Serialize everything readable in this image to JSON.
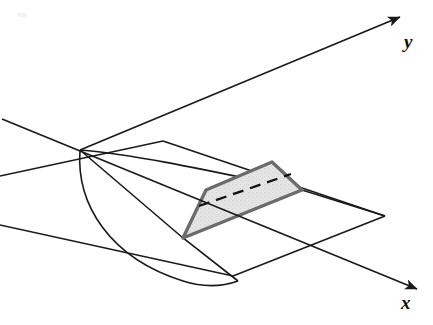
{
  "figure": {
    "background_color": "#ffffff",
    "stroke_color": "#1a1a1a",
    "cross_section_fill": "#e4e4e4",
    "cross_section_stroke": "#6b6b6b",
    "dashed_stroke": "#111111"
  },
  "axes": [
    {
      "name": "y-axis",
      "label": "y",
      "label_position": {
        "x": 404,
        "y": 32
      },
      "from": {
        "x": 80,
        "y": 150
      },
      "to": {
        "x": 400,
        "y": 17
      },
      "arrow": true
    },
    {
      "name": "x-axis",
      "label": "x",
      "label_position": {
        "x": 401,
        "y": 293
      },
      "from": {
        "x": 2,
        "y": 119
      },
      "to": {
        "x": 417,
        "y": 289
      },
      "arrow": true
    }
  ],
  "cone": {
    "apex": {
      "x": 80,
      "y": 150
    },
    "left_generator_end": {
      "x": 183,
      "y": 238
    },
    "right_generator_end": {
      "x": 302,
      "y": 190
    },
    "directrix_curve": {
      "start": {
        "x": 80,
        "y": 150
      },
      "control": {
        "x": 83,
        "y": 236
      },
      "end": {
        "x": 238,
        "y": 281
      }
    }
  },
  "plane": {
    "name": "cutting-plane",
    "corners": [
      {
        "x": 0,
        "y": 176
      },
      {
        "x": 163,
        "y": 141
      },
      {
        "x": 385,
        "y": 216
      },
      {
        "x": 233,
        "y": 276
      }
    ]
  },
  "cross_section": {
    "name": "shaded-cross-section",
    "vertices": [
      {
        "x": 183,
        "y": 238
      },
      {
        "x": 206,
        "y": 190
      },
      {
        "x": 272,
        "y": 162
      },
      {
        "x": 302,
        "y": 190
      }
    ],
    "dashed_diagonal": {
      "from": {
        "x": 199,
        "y": 206
      },
      "to": {
        "x": 291,
        "y": 174
      }
    }
  },
  "artifact": {
    "name": "scan-speck",
    "position": {
      "x": 22,
      "y": 15
    }
  }
}
